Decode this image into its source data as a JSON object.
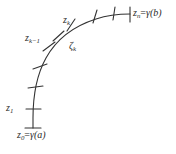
{
  "figure": {
    "background_color": "#ffffff",
    "curve_color": "#333333",
    "label_color": "#2b2b2b",
    "curve": {
      "description": "smooth quarter-arc style curve rising from lower-left to upper-right",
      "path": "M 33 128 L 33 118 C 33 96 36 76 46 58 C 56 40 74 26 96 19 C 108 15 120 14 130 14",
      "stroke_width": 1.1
    },
    "endpoint_ticks": [
      {
        "name": "tick-z0",
        "x1": 25,
        "y1": 128,
        "x2": 41,
        "y2": 128
      },
      {
        "name": "tick-zn",
        "x1": 130,
        "y1": 7,
        "x2": 130,
        "y2": 22
      }
    ],
    "partition_ticks": [
      {
        "name": "tick-z1",
        "x1": 26,
        "y1": 109,
        "x2": 41,
        "y2": 109
      },
      {
        "name": "tick-p2",
        "x1": 28,
        "y1": 88,
        "x2": 43,
        "y2": 86
      },
      {
        "name": "tick-p3",
        "x1": 33,
        "y1": 69,
        "x2": 47,
        "y2": 64
      },
      {
        "name": "tick-zkm1",
        "x1": 43,
        "y1": 51,
        "x2": 55,
        "y2": 42
      },
      {
        "name": "tick-zetak",
        "x1": 53,
        "y1": 41,
        "x2": 64,
        "y2": 31
      },
      {
        "name": "tick-zk",
        "x1": 67,
        "y1": 31,
        "x2": 75,
        "y2": 19
      },
      {
        "name": "tick-p7",
        "x1": 93,
        "y1": 23,
        "x2": 97,
        "y2": 10
      },
      {
        "name": "tick-p8",
        "x1": 113,
        "y1": 20,
        "x2": 115,
        "y2": 7
      }
    ],
    "labels": [
      {
        "name": "label-z0",
        "text": "z0=γ(a)",
        "var": "z",
        "sub": "0",
        "rest": "=",
        "gamma": "γ",
        "arg": "(a)"
      },
      {
        "name": "label-z1",
        "text": "z1",
        "var": "z",
        "sub": "1"
      },
      {
        "name": "label-zk-minus-1",
        "text": "zk−1",
        "var": "z",
        "sub": "k−1"
      },
      {
        "name": "label-zk",
        "text": "zk",
        "var": "z",
        "sub": "k"
      },
      {
        "name": "label-zeta-k",
        "text": "ζk",
        "var": "ζ",
        "sub": "k"
      },
      {
        "name": "label-zn",
        "text": "zn=γ(b)",
        "var": "z",
        "sub": "n",
        "rest": "=",
        "gamma": "γ",
        "arg": "(b)"
      }
    ]
  }
}
